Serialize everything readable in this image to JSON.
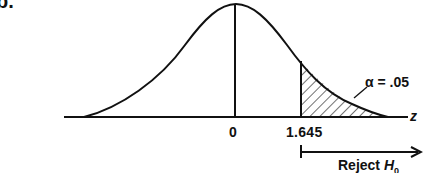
{
  "figure": {
    "part_label": "b.",
    "distribution": "standard normal",
    "center_label": "0",
    "critical_value_label": "1.645",
    "alpha_label": "α = .05",
    "axis_label": "z",
    "region_label": "Reject",
    "region_symbol": "H",
    "region_subscript": "0",
    "shaded_region": "right tail beyond 1.645 (hatched)",
    "colors": {
      "ink": "#111111",
      "background": "#ffffff"
    }
  }
}
